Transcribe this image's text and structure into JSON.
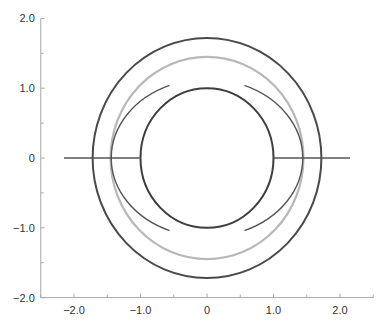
{
  "chart_data": {
    "type": "line",
    "title": "",
    "xlabel": "",
    "ylabel": "",
    "xlim": [
      -2.5,
      2.5
    ],
    "ylim": [
      -2.0,
      2.0
    ],
    "grid": false,
    "x_ticks": [
      {
        "value": -2.0,
        "label": "−2.0"
      },
      {
        "value": -1.0,
        "label": "−1.0"
      },
      {
        "value": 0,
        "label": "0"
      },
      {
        "value": 1.0,
        "label": "1.0"
      },
      {
        "value": 2.0,
        "label": "2.0"
      }
    ],
    "x_minor_ticks": [
      -2.5,
      -1.5,
      -0.5,
      0.5,
      1.5,
      2.5
    ],
    "y_ticks": [
      {
        "value": 2.0,
        "label": "2.0"
      },
      {
        "value": 1.0,
        "label": "1.0"
      },
      {
        "value": 0,
        "label": "0"
      },
      {
        "value": -1.0,
        "label": "−1.0"
      },
      {
        "value": -2.0,
        "label": "−2.0"
      }
    ],
    "y_minor_ticks": [
      1.5,
      0.5,
      -0.5,
      -1.5
    ],
    "series": [
      {
        "name": "outer-circle",
        "kind": "circle",
        "cx": 0,
        "cy": 0,
        "r": 1.72,
        "color": "#4a4a4a"
      },
      {
        "name": "gray-circle",
        "kind": "circle",
        "cx": 0,
        "cy": 0,
        "r": 1.45,
        "color": "#b8b8b8"
      },
      {
        "name": "inner-circle",
        "kind": "circle",
        "cx": 0,
        "cy": 0,
        "r": 1.0,
        "color": "#3e3e3e"
      },
      {
        "name": "left-arc",
        "kind": "arc",
        "side": "left",
        "rx": 1.44,
        "ry": 1.13,
        "y_extent": 1.04,
        "color": "#555555"
      },
      {
        "name": "right-arc",
        "kind": "arc",
        "side": "right",
        "rx": 1.44,
        "ry": 1.13,
        "y_extent": 1.04,
        "color": "#555555"
      },
      {
        "name": "left-segment",
        "kind": "segment",
        "x": [
          -2.15,
          -1.0
        ],
        "y": [
          0,
          0
        ],
        "color": "#555555"
      },
      {
        "name": "right-segment",
        "kind": "segment",
        "x": [
          1.0,
          2.15
        ],
        "y": [
          0,
          0
        ],
        "color": "#555555"
      }
    ]
  }
}
